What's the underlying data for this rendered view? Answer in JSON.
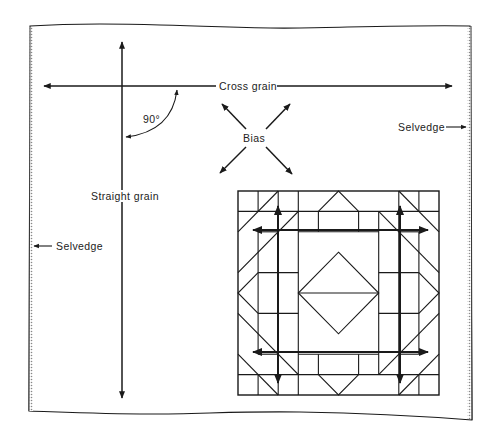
{
  "diagram": {
    "type": "fabric-grain-diagram",
    "labels": {
      "cross_grain": "Cross grain",
      "straight_grain": "Straight grain",
      "bias": "Bias",
      "angle": "90°",
      "selvedge_right": "Selvedge",
      "selvedge_left": "Selvedge"
    },
    "colors": {
      "line": "#1a1a1a",
      "background": "#ffffff",
      "selvedge_edge": "#555555"
    },
    "elements": [
      {
        "id": "fabric-piece",
        "shape": "rectangle-wavy-edges",
        "note": "fabric piece with dotted selvedge on left and right"
      },
      {
        "id": "cross-grain-arrow",
        "shape": "double-arrow",
        "direction": "horizontal"
      },
      {
        "id": "straight-grain-arrow",
        "shape": "double-arrow",
        "direction": "vertical"
      },
      {
        "id": "angle-arc",
        "shape": "arc-arrow",
        "label": "90°"
      },
      {
        "id": "bias-arrows",
        "shape": "x-double-arrows",
        "label": "Bias"
      },
      {
        "id": "quilt-block",
        "shape": "patchwork-block",
        "grid": "10x10",
        "arrows": 4
      }
    ]
  }
}
